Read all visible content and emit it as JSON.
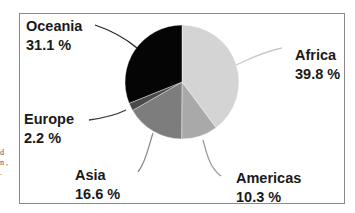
{
  "chart_data": {
    "type": "pie",
    "title": "",
    "categories": [
      "Africa",
      "Americas",
      "Asia",
      "Europe",
      "Oceania"
    ],
    "values": [
      39.8,
      10.3,
      16.6,
      2.2,
      31.1
    ],
    "value_labels": [
      "39.8 %",
      "10.3 %",
      "16.6 %",
      "2.2 %",
      "31.1 %"
    ],
    "colors": [
      "#d4d4d4",
      "#a9a9a9",
      "#7d7d7d",
      "#4a4a4a",
      "#050505"
    ],
    "start_angle": "12 o'clock",
    "direction": "clockwise",
    "legend": "none (leader-line labels)"
  },
  "labels": {
    "africa": {
      "name": "Africa",
      "pct": "39.8 %"
    },
    "americas": {
      "name": "Americas",
      "pct": "10.3 %"
    },
    "asia": {
      "name": "Asia",
      "pct": "16.6 %"
    },
    "europe": {
      "name": "Europe",
      "pct": "2.2 %"
    },
    "oceania": {
      "name": "Oceania",
      "pct": "31.1 %"
    }
  },
  "edge_fragment": "d n , ."
}
